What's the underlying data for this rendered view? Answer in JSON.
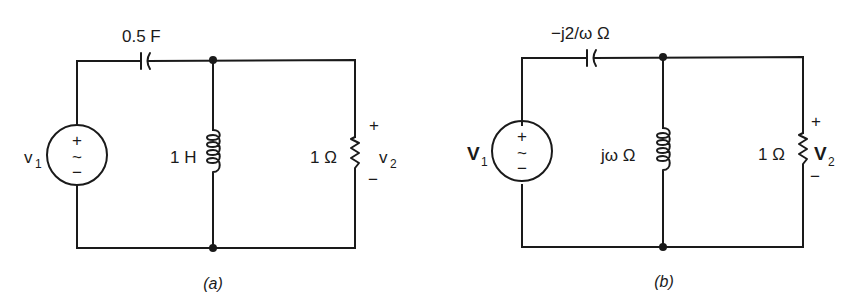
{
  "figure": {
    "circuits": [
      {
        "id": "a",
        "caption": "(a)",
        "source": {
          "label": "v",
          "subscript": "1",
          "plus": "+",
          "tilde": "~",
          "minus": "−"
        },
        "capacitor": {
          "label": "0.5 F"
        },
        "inductor": {
          "label": "1 H"
        },
        "resistor": {
          "label": "1 Ω"
        },
        "output": {
          "label": "v",
          "subscript": "2",
          "plus": "+",
          "minus": "−"
        }
      },
      {
        "id": "b",
        "caption": "(b)",
        "source": {
          "label": "V",
          "subscript": "1",
          "plus": "+",
          "tilde": "~",
          "minus": "−"
        },
        "capacitor": {
          "label": "−j2/ω Ω"
        },
        "inductor": {
          "label": "jω Ω"
        },
        "resistor": {
          "label": "1 Ω"
        },
        "output": {
          "label": "V",
          "subscript": "2",
          "plus": "+",
          "minus": "−"
        }
      }
    ],
    "colors": {
      "ink": "#1a1a1a",
      "background": "#ffffff"
    }
  }
}
